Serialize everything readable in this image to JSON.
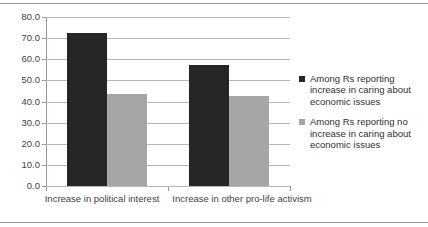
{
  "chart_data": {
    "type": "bar",
    "title": "",
    "xlabel": "",
    "ylabel": "",
    "categories": [
      "Increase in political interest",
      "Increase in other pro-life activism"
    ],
    "series": [
      {
        "name": "Among Rs reporting increase in caring about economic issues",
        "color": "#262626",
        "values": [
          72.5,
          57.5
        ]
      },
      {
        "name": "Among Rs reporting no increase in caring about economic issues",
        "color": "#a6a6a6",
        "values": [
          43.5,
          42.5
        ]
      }
    ],
    "ylim": [
      0.0,
      80.0
    ],
    "ytick_step": 10.0,
    "ytick_labels": [
      "80.0",
      "70.0",
      "60.0",
      "50.0",
      "40.0",
      "30.0",
      "20.0",
      "10.0",
      "0.0"
    ],
    "grid": "horizontal",
    "legend_position": "right"
  },
  "axis": {
    "y_labels": [
      "80.0",
      "70.0",
      "60.0",
      "50.0",
      "40.0",
      "30.0",
      "20.0",
      "10.0",
      "0.0"
    ],
    "x_labels": [
      "Increase in political interest",
      "Increase in other pro-life activism"
    ]
  },
  "legend": {
    "entries": [
      {
        "label": "Among Rs reporting increase in caring about economic issues",
        "color": "#262626"
      },
      {
        "label": "Among Rs reporting no increase in caring about economic issues",
        "color": "#a6a6a6"
      }
    ]
  },
  "colors": {
    "series_dark": "#262626",
    "series_light": "#a6a6a6",
    "gridline": "#b6b6b6",
    "axis": "#9a9a9a",
    "background": "#ffffff",
    "text": "#3f3f3f"
  }
}
